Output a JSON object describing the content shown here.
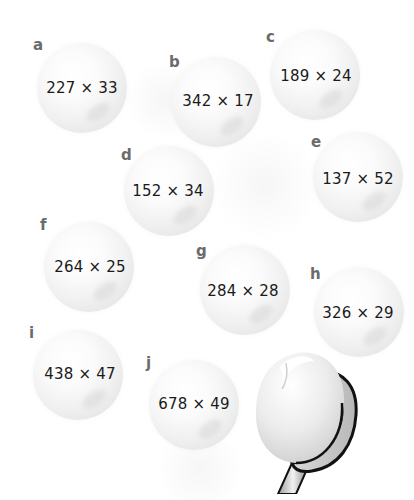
{
  "worksheet": {
    "problems": [
      {
        "letter": "a",
        "expression": "227 × 33"
      },
      {
        "letter": "b",
        "expression": "342 × 17"
      },
      {
        "letter": "c",
        "expression": "189 × 24"
      },
      {
        "letter": "d",
        "expression": "152 × 34"
      },
      {
        "letter": "e",
        "expression": "137 × 52"
      },
      {
        "letter": "f",
        "expression": "264 × 25"
      },
      {
        "letter": "g",
        "expression": "284 × 28"
      },
      {
        "letter": "h",
        "expression": "326 × 29"
      },
      {
        "letter": "i",
        "expression": "438 × 47"
      },
      {
        "letter": "j",
        "expression": "678 × 49"
      }
    ],
    "illustration": "table-tennis-paddle-with-ball"
  },
  "colors": {
    "background": "#ffffff",
    "ball": "#f2f2f2",
    "letter": "#6b6b6b",
    "expression_text": "#1a1a1a",
    "paddle_outline": "#111111"
  }
}
